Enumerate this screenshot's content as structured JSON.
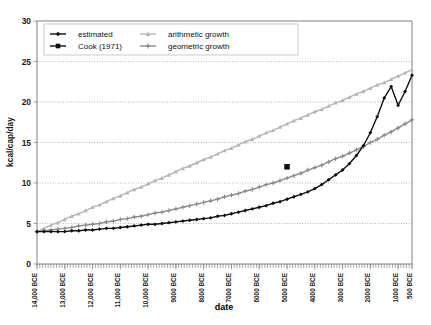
{
  "chart_data": {
    "type": "line",
    "title": "",
    "xlabel": "date",
    "ylabel": "kcal/cap/day",
    "ylim": [
      0,
      30
    ],
    "yticks": [
      "0",
      "5",
      "10",
      "15",
      "20",
      "25",
      "30"
    ],
    "ytick_values": [
      0,
      5,
      10,
      15,
      20,
      25,
      30
    ],
    "grid": "horizontal-dotted",
    "legend_position": "top-left-inside",
    "x_axis_direction": "descending",
    "xtick_labels": [
      "14,000 BCE",
      "13,000 BCE",
      "12,000 BCE",
      "11,000 BCE",
      "10,000 BCE",
      "9000 BCE",
      "8000 BCE",
      "7000 BCE",
      "6000 BCE",
      "5000 BCE",
      "4000 BCE",
      "3000 BCE",
      "2000 BCE",
      "1000 BCE",
      "500 BCE"
    ],
    "xtick_values": [
      14000,
      13000,
      12000,
      11000,
      10000,
      9000,
      8000,
      7000,
      6000,
      5000,
      4000,
      3000,
      2000,
      1000,
      500
    ],
    "xlim": [
      14000,
      500
    ],
    "legend": [
      {
        "label": "estimated",
        "marker": "diamond",
        "color": "#101010"
      },
      {
        "label": "Cook (1971)",
        "marker": "square",
        "color": "#101010"
      },
      {
        "label": "arithmetic growth",
        "marker": "triangle",
        "color": "#b5b5b5"
      },
      {
        "label": "geometric growth",
        "marker": "cross",
        "color": "#8b8b8b"
      }
    ],
    "series": [
      {
        "name": "estimated",
        "color": "#101010",
        "marker": "diamond",
        "x": [
          14000,
          13750,
          13500,
          13250,
          13000,
          12750,
          12500,
          12250,
          12000,
          11750,
          11500,
          11250,
          11000,
          10750,
          10500,
          10250,
          10000,
          9750,
          9500,
          9250,
          9000,
          8750,
          8500,
          8250,
          8000,
          7750,
          7500,
          7250,
          7000,
          6750,
          6500,
          6250,
          6000,
          5750,
          5500,
          5250,
          5000,
          4750,
          4500,
          4250,
          4000,
          3750,
          3500,
          3250,
          3000,
          2750,
          2500,
          2250,
          2000,
          1750,
          1500,
          1250,
          1000,
          750,
          500
        ],
        "values": [
          4.0,
          4.0,
          4.0,
          4.0,
          4.0,
          4.1,
          4.1,
          4.2,
          4.2,
          4.3,
          4.4,
          4.4,
          4.5,
          4.6,
          4.7,
          4.8,
          4.9,
          4.9,
          5.0,
          5.1,
          5.2,
          5.3,
          5.4,
          5.5,
          5.6,
          5.7,
          5.9,
          6.0,
          6.2,
          6.4,
          6.6,
          6.8,
          7.0,
          7.2,
          7.5,
          7.7,
          8.0,
          8.3,
          8.6,
          8.9,
          9.3,
          9.8,
          10.4,
          11.0,
          11.6,
          12.4,
          13.4,
          14.6,
          16.2,
          18.2,
          20.5,
          21.9,
          19.6,
          21.3,
          23.3
        ]
      },
      {
        "name": "arithmetic growth",
        "color": "#b5b5b5",
        "marker": "triangle",
        "x": [
          14000,
          13750,
          13500,
          13250,
          13000,
          12750,
          12500,
          12250,
          12000,
          11750,
          11500,
          11250,
          11000,
          10750,
          10500,
          10250,
          10000,
          9750,
          9500,
          9250,
          9000,
          8750,
          8500,
          8250,
          8000,
          7750,
          7500,
          7250,
          7000,
          6750,
          6500,
          6250,
          6000,
          5750,
          5500,
          5250,
          5000,
          4750,
          4500,
          4250,
          4000,
          3750,
          3500,
          3250,
          3000,
          2750,
          2500,
          2250,
          2000,
          1750,
          1500,
          1250,
          1000,
          750,
          500
        ],
        "values": [
          4.0,
          4.4,
          4.8,
          5.1,
          5.5,
          5.9,
          6.2,
          6.6,
          7.0,
          7.3,
          7.7,
          8.1,
          8.4,
          8.8,
          9.2,
          9.5,
          9.9,
          10.3,
          10.6,
          11.0,
          11.4,
          11.8,
          12.1,
          12.5,
          12.9,
          13.2,
          13.6,
          14.0,
          14.3,
          14.7,
          15.1,
          15.4,
          15.8,
          16.2,
          16.5,
          16.9,
          17.3,
          17.7,
          18.0,
          18.4,
          18.8,
          19.1,
          19.5,
          19.9,
          20.2,
          20.6,
          21.0,
          21.3,
          21.7,
          22.1,
          22.4,
          22.8,
          23.2,
          23.6,
          24.0
        ]
      },
      {
        "name": "geometric growth",
        "color": "#8b8b8b",
        "marker": "cross",
        "x": [
          14000,
          13750,
          13500,
          13250,
          13000,
          12750,
          12500,
          12250,
          12000,
          11750,
          11500,
          11250,
          11000,
          10750,
          10500,
          10250,
          10000,
          9750,
          9500,
          9250,
          9000,
          8750,
          8500,
          8250,
          8000,
          7750,
          7500,
          7250,
          7000,
          6750,
          6500,
          6250,
          6000,
          5750,
          5500,
          5250,
          5000,
          4750,
          4500,
          4250,
          4000,
          3750,
          3500,
          3250,
          3000,
          2750,
          2500,
          2250,
          2000,
          1750,
          1500,
          1250,
          1000,
          750,
          500
        ],
        "values": [
          4.0,
          4.1,
          4.2,
          4.3,
          4.4,
          4.5,
          4.7,
          4.8,
          4.9,
          5.0,
          5.2,
          5.3,
          5.5,
          5.6,
          5.8,
          5.9,
          6.1,
          6.3,
          6.4,
          6.6,
          6.8,
          7.0,
          7.2,
          7.4,
          7.6,
          7.8,
          8.0,
          8.3,
          8.5,
          8.7,
          9.0,
          9.2,
          9.5,
          9.8,
          10.0,
          10.3,
          10.6,
          10.9,
          11.2,
          11.6,
          11.9,
          12.2,
          12.6,
          13.0,
          13.3,
          13.7,
          14.1,
          14.5,
          15.0,
          15.4,
          15.9,
          16.3,
          16.8,
          17.3,
          17.8
        ]
      }
    ],
    "point_series": [
      {
        "name": "Cook (1971)",
        "color": "#101010",
        "marker": "square",
        "points": [
          {
            "x": 5000,
            "y": 12.0
          }
        ]
      }
    ]
  }
}
